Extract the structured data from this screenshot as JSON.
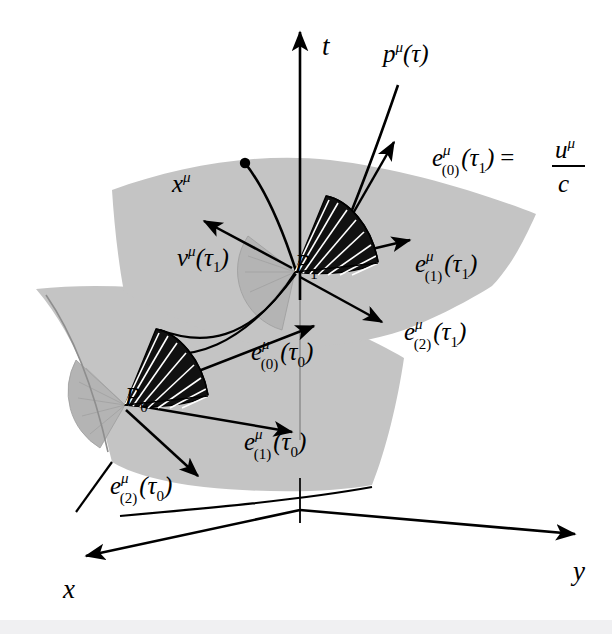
{
  "figure": {
    "background_color": "#ffffff",
    "surface_color": "#c4c4c4",
    "cone_color": "#111111",
    "bottom_band_color": "#f0f0f2"
  },
  "axes": [
    {
      "id": "t",
      "label": "t",
      "direction": "up",
      "label_x": 322,
      "label_y": 55
    },
    {
      "id": "x",
      "label": "x",
      "direction": "lower-left",
      "label_x": 63,
      "label_y": 598
    },
    {
      "id": "y",
      "label": "y",
      "direction": "lower-right",
      "label_x": 573,
      "label_y": 580
    }
  ],
  "points": [
    {
      "id": "P1",
      "base": "P",
      "sub": "1",
      "x": 295,
      "y": 272
    },
    {
      "id": "P0",
      "base": "P",
      "sub": "0",
      "x": 125,
      "y": 405
    }
  ],
  "event": {
    "label_base": "x",
    "label_sup": "μ",
    "label_x": 172,
    "label_y": 192,
    "dot_x": 245,
    "dot_y": 163
  },
  "momentum": {
    "label_base": "p",
    "label_sup": "μ",
    "label_arg": "(τ)",
    "label_x": 383,
    "label_y": 62
  },
  "velocity": {
    "label_base": "v",
    "label_sup": "μ",
    "label_arg": "(τ",
    "label_sub": "1",
    "label_close": ")",
    "label_x": 177,
    "label_y": 266
  },
  "tetrad_labels": [
    {
      "id": "e0-tau1",
      "base": "e",
      "sup": "μ",
      "index": "(0)",
      "arg_open": "(τ",
      "arg_sub": "1",
      "arg_close": ")",
      "equals": "=",
      "frac_num_base": "u",
      "frac_num_sup": "μ",
      "frac_den": "c",
      "x": 432,
      "y": 166
    },
    {
      "id": "e1-tau1",
      "base": "e",
      "sup": "μ",
      "index": "(1)",
      "arg_open": "(τ",
      "arg_sub": "1",
      "arg_close": ")",
      "x": 415,
      "y": 272
    },
    {
      "id": "e2-tau1",
      "base": "e",
      "sup": "μ",
      "index": "(2)",
      "arg_open": "(τ",
      "arg_sub": "1",
      "arg_close": ")",
      "x": 404,
      "y": 340
    },
    {
      "id": "e0-tau0",
      "base": "e",
      "sup": "μ",
      "index": "(0)",
      "arg_open": "(τ",
      "arg_sub": "0",
      "arg_close": ")",
      "x": 251,
      "y": 360
    },
    {
      "id": "e1-tau0",
      "base": "e",
      "sup": "μ",
      "index": "(1)",
      "arg_open": "(τ",
      "arg_sub": "0",
      "arg_close": ")",
      "x": 244,
      "y": 450
    },
    {
      "id": "e2-tau0",
      "base": "e",
      "sup": "μ",
      "index": "(2)",
      "arg_open": "(τ",
      "arg_sub": "0",
      "arg_close": ")",
      "x": 110,
      "y": 494
    }
  ],
  "geometry": {
    "upper_surface_path": "M 112,190 C 180,165 260,152 330,160 C 400,168 480,192 536,214 C 520,250 506,272 492,286 C 470,300 436,318 404,330 C 360,345 300,352 250,343 C 200,333 160,310 124,292 C 118,260 114,222 112,190 Z",
    "lower_surface_path": "M 36,289 C 110,281 200,290 272,306 C 330,320 374,340 404,358 C 398,400 386,450 372,485 C 330,493 260,493 204,487 C 160,482 128,472 112,462 C 100,410 80,340 36,289 Z",
    "t_axis": {
      "x1": 300,
      "y1": 523,
      "x2": 300,
      "y2": 32
    },
    "x_axis": {
      "x1": 300,
      "y1": 510,
      "x2": 83,
      "y2": 557
    },
    "y_axis": {
      "x1": 300,
      "y1": 510,
      "x2": 578,
      "y2": 535
    },
    "worldline_upper": "M 245,163 C 270,195 286,240 296,271",
    "worldline_lower": "M 160,330 C 200,345 250,345 296,271",
    "momentum_curve": "M 398,85 C 386,120 372,160 352,210",
    "cone_P1": {
      "apex_x": 295,
      "apex_y": 272
    },
    "cone_P0": {
      "apex_x": 125,
      "apex_y": 405
    }
  },
  "vectors": [
    {
      "id": "v-tau1",
      "x1": 292,
      "y1": 268,
      "x2": 202,
      "y2": 220,
      "head": true
    },
    {
      "id": "e0-tau1-vec",
      "x1": 330,
      "y1": 248,
      "x2": 392,
      "y2": 140,
      "head": true
    },
    {
      "id": "e1-tau1-vec",
      "x1": 298,
      "y1": 266,
      "x2": 410,
      "y2": 240,
      "head": true
    },
    {
      "id": "e2-tau1-vec",
      "x1": 298,
      "y1": 276,
      "x2": 380,
      "y2": 320,
      "head": true
    },
    {
      "id": "e0-tau0-vec",
      "x1": 160,
      "y1": 386,
      "x2": 312,
      "y2": 325,
      "head": true
    },
    {
      "id": "e1-tau0-vec",
      "x1": 128,
      "y1": 404,
      "x2": 290,
      "y2": 432,
      "head": true
    },
    {
      "id": "e2-tau0-vec",
      "x1": 126,
      "y1": 410,
      "x2": 196,
      "y2": 474,
      "head": true
    }
  ]
}
